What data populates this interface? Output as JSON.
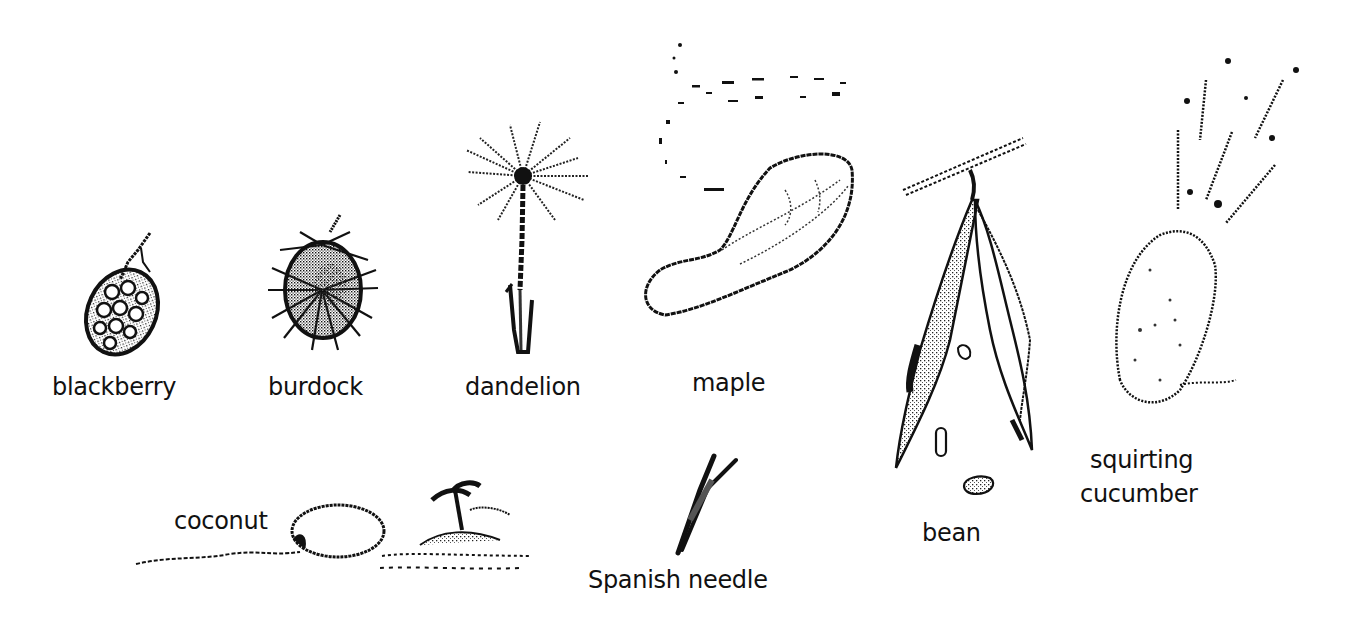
{
  "diagram": {
    "type": "seed-dispersal-illustrations",
    "style": "dithered black-and-white pencil sketches",
    "colors": {
      "background": "#ffffff",
      "ink": "#111111",
      "shade": "#555555"
    },
    "items": [
      {
        "id": "blackberry",
        "label": "blackberry",
        "depiction": "berry on stalk"
      },
      {
        "id": "burdock",
        "label": "burdock",
        "depiction": "spiky burr"
      },
      {
        "id": "dandelion",
        "label": "dandelion",
        "depiction": "seed head with pappus on stem"
      },
      {
        "id": "maple",
        "label": "maple",
        "depiction": "winged samara with dotted flight path"
      },
      {
        "id": "bean",
        "label": "bean",
        "depiction": "split pod hanging from branch with seeds falling"
      },
      {
        "id": "squirting-cucumber",
        "label_line1": "squirting",
        "label_line2": "cucumber",
        "depiction": "fruit ejecting seeds in streaks"
      },
      {
        "id": "coconut",
        "label": "coconut",
        "depiction": "coconut floating on water toward island with palm tree"
      },
      {
        "id": "spanish-needle",
        "label": "Spanish needle",
        "depiction": "two-pronged barbed seed"
      }
    ]
  }
}
